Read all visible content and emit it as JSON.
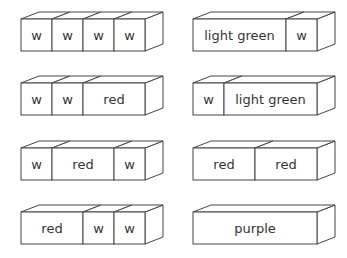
{
  "diagram": {
    "type": "cuisenaire-rod-trains",
    "unit_lengths": {
      "w": 1,
      "red": 2,
      "light green": 3,
      "purple": 4
    },
    "trains": [
      {
        "column": 0,
        "row": 0,
        "rods": [
          {
            "label": "w",
            "units": 1
          },
          {
            "label": "w",
            "units": 1
          },
          {
            "label": "w",
            "units": 1
          },
          {
            "label": "w",
            "units": 1
          }
        ]
      },
      {
        "column": 1,
        "row": 0,
        "rods": [
          {
            "label": "light green",
            "units": 3
          },
          {
            "label": "w",
            "units": 1
          }
        ]
      },
      {
        "column": 0,
        "row": 1,
        "rods": [
          {
            "label": "w",
            "units": 1
          },
          {
            "label": "w",
            "units": 1
          },
          {
            "label": "red",
            "units": 2
          }
        ]
      },
      {
        "column": 1,
        "row": 1,
        "rods": [
          {
            "label": "w",
            "units": 1
          },
          {
            "label": "light green",
            "units": 3
          }
        ]
      },
      {
        "column": 0,
        "row": 2,
        "rods": [
          {
            "label": "w",
            "units": 1
          },
          {
            "label": "red",
            "units": 2
          },
          {
            "label": "w",
            "units": 1
          }
        ]
      },
      {
        "column": 1,
        "row": 2,
        "rods": [
          {
            "label": "red",
            "units": 2
          },
          {
            "label": "red",
            "units": 2
          }
        ]
      },
      {
        "column": 0,
        "row": 3,
        "rods": [
          {
            "label": "red",
            "units": 2
          },
          {
            "label": "w",
            "units": 1
          },
          {
            "label": "w",
            "units": 1
          }
        ]
      },
      {
        "column": 1,
        "row": 3,
        "rods": [
          {
            "label": "purple",
            "units": 4
          }
        ]
      }
    ]
  },
  "colors": {
    "stroke": "#444444",
    "fill": "#ffffff",
    "text": "#333333"
  }
}
